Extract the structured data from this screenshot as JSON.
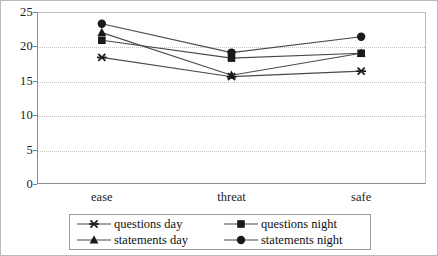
{
  "chart_data": {
    "type": "line",
    "title": "",
    "subtitle": "",
    "xlabel": "",
    "ylabel": "",
    "categories": [
      "ease",
      "threat",
      "safe"
    ],
    "ylim": [
      0,
      25
    ],
    "yticks": [
      0,
      5,
      10,
      15,
      20,
      25
    ],
    "ytick_labels": [
      "0",
      "5",
      "10",
      "15",
      "20",
      "25"
    ],
    "grid": true,
    "grid_axis": "y",
    "legend_position": "bottom",
    "series": [
      {
        "name": "questions day",
        "marker": "asterisk-marker",
        "color": "#1a1a1a",
        "values": [
          18.4,
          15.6,
          16.4
        ]
      },
      {
        "name": "questions night",
        "marker": "square-marker",
        "color": "#1a1a1a",
        "values": [
          20.9,
          18.3,
          19.0
        ]
      },
      {
        "name": "statements day",
        "marker": "triangle-marker",
        "color": "#1a1a1a",
        "values": [
          22.0,
          15.8,
          19.0
        ]
      },
      {
        "name": "statements night",
        "marker": "circle-marker",
        "color": "#1a1a1a",
        "values": [
          23.3,
          19.1,
          21.4
        ]
      }
    ]
  },
  "legend": {
    "entries": [
      {
        "label": "questions day",
        "marker": "asterisk-marker"
      },
      {
        "label": "questions night",
        "marker": "square-marker"
      },
      {
        "label": "statements day",
        "marker": "triangle-marker"
      },
      {
        "label": "statements night",
        "marker": "circle-marker"
      }
    ]
  },
  "colors": {
    "line": "#4a4a4a",
    "marker": "#1a1a1a",
    "grid": "#c5c5c5",
    "axis": "#8d8d8d",
    "frame": "#b9b9b9",
    "background": "#ffffff",
    "text": "#1c1c1c"
  }
}
